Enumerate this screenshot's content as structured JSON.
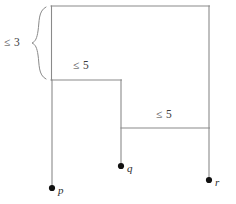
{
  "diagram": {
    "type": "hierarchy-tree-with-bounds",
    "background_color": "#ffffff",
    "line_color": "#8a8a8a",
    "node_color": "#111111",
    "labels": {
      "root_bound": "≤ 3",
      "branch_one_bound": "≤ 5",
      "branch_two_bound": "≤ 5"
    },
    "nodes": [
      {
        "id": "p",
        "label": "p",
        "x": 52,
        "y": 188
      },
      {
        "id": "q",
        "label": "q",
        "x": 121,
        "y": 166
      },
      {
        "id": "r",
        "label": "r",
        "x": 209,
        "y": 180
      }
    ],
    "segments": [
      {
        "name": "top-horizontal",
        "x1": 51,
        "y1": 6,
        "x2": 209,
        "y2": 6
      },
      {
        "name": "left-vertical-upper",
        "x1": 51,
        "y1": 6,
        "x2": 51,
        "y2": 80
      },
      {
        "name": "left-vertical-lower",
        "x1": 52,
        "y1": 80,
        "x2": 52,
        "y2": 188
      },
      {
        "name": "mid-horizontal",
        "x1": 51,
        "y1": 80,
        "x2": 121,
        "y2": 80
      },
      {
        "name": "mid-vertical",
        "x1": 121,
        "y1": 80,
        "x2": 121,
        "y2": 166
      },
      {
        "name": "lower-horizontal",
        "x1": 121,
        "y1": 128,
        "x2": 209,
        "y2": 128
      },
      {
        "name": "right-vertical",
        "x1": 209,
        "y1": 6,
        "x2": 209,
        "y2": 180
      }
    ],
    "brace": {
      "name": "left-curly-brace",
      "top_y": 6,
      "bottom_y": 80,
      "tip_x": 32,
      "tip_y": 43,
      "attach_x": 46
    }
  }
}
